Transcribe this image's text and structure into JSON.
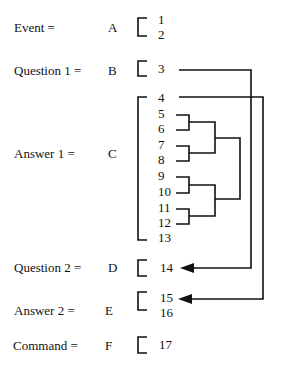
{
  "rows": [
    {
      "label": "Event =",
      "letter": "A",
      "items": [
        "1",
        "2"
      ]
    },
    {
      "label": "Question 1 =",
      "letter": "B",
      "items": [
        "3"
      ]
    },
    {
      "label": "Answer 1 =",
      "letter": "C",
      "items": [
        "4",
        "5",
        "6",
        "7",
        "8",
        "9",
        "10",
        "11",
        "12",
        "13"
      ]
    },
    {
      "label": "Question 2 =",
      "letter": "D",
      "items": [
        "14"
      ]
    },
    {
      "label": "Answer 2 =",
      "letter": "E",
      "items": [
        "15",
        "16"
      ]
    },
    {
      "label": "Command =",
      "letter": "F",
      "items": [
        "17"
      ]
    }
  ],
  "links": [
    {
      "from": "3",
      "to": "14",
      "type": "arrow"
    },
    {
      "from": "4",
      "to": "15",
      "type": "arrow"
    }
  ],
  "clusters": [
    {
      "members": [
        "5",
        "6"
      ]
    },
    {
      "members": [
        "7",
        "8"
      ]
    },
    {
      "members": [
        "9",
        "10"
      ]
    },
    {
      "members": [
        "11",
        "12"
      ]
    },
    {
      "members": [
        "5",
        "6",
        "7",
        "8"
      ]
    },
    {
      "members": [
        "9",
        "10",
        "11",
        "12"
      ]
    },
    {
      "members": [
        "5",
        "6",
        "7",
        "8",
        "9",
        "10",
        "11",
        "12"
      ]
    }
  ],
  "colors": {
    "line": "#111111",
    "background": "#ffffff"
  }
}
